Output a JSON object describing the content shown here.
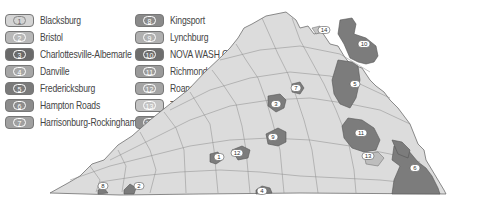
{
  "legend": {
    "items": [
      {
        "num": "1",
        "label": "Blacksburg",
        "color": "#d4d4d4",
        "text": "#666"
      },
      {
        "num": "2",
        "label": "Bristol",
        "color": "#b8b8b8",
        "text": "#fff"
      },
      {
        "num": "3",
        "label": "Charlottesville-Albemarle",
        "color": "#6a6a6a",
        "text": "#fff"
      },
      {
        "num": "4",
        "label": "Danville",
        "color": "#a6a6a6",
        "text": "#fff"
      },
      {
        "num": "5",
        "label": "Fredericksburg",
        "color": "#7a7a7a",
        "text": "#fff"
      },
      {
        "num": "6",
        "label": "Hampton Roads",
        "color": "#8c8c8c",
        "text": "#fff"
      },
      {
        "num": "7",
        "label": "Harrisonburg-Rockingham",
        "color": "#a0a0a0",
        "text": "#fff"
      },
      {
        "num": "8",
        "label": "Kingsport",
        "color": "#8a8a8a",
        "text": "#fff"
      },
      {
        "num": "9",
        "label": "Lynchburg",
        "color": "#b0b0b0",
        "text": "#fff"
      },
      {
        "num": "10",
        "label": "NOVA WASH COG",
        "color": "#6e6e6e",
        "text": "#fff"
      },
      {
        "num": "11",
        "label": "Richmond",
        "color": "#9a9a9a",
        "text": "#fff"
      },
      {
        "num": "12",
        "label": "Roanoke Valley",
        "color": "#a4a4a4",
        "text": "#fff"
      },
      {
        "num": "13",
        "label": "Tri-Cities",
        "color": "#c4c4c4",
        "text": "#fff"
      },
      {
        "num": "14",
        "label": "Winchester",
        "color": "#8e8e8e",
        "text": "#fff"
      }
    ]
  },
  "map": {
    "title": "Virginia metropolitan planning regions",
    "base_color": "#dcdcdc",
    "border_color": "#6e6e6e",
    "region_color": "#7c7c7c",
    "markers": [
      "14",
      "10",
      "5",
      "7",
      "3",
      "9",
      "12",
      "1",
      "4",
      "11",
      "13",
      "6",
      "8",
      "2"
    ]
  }
}
